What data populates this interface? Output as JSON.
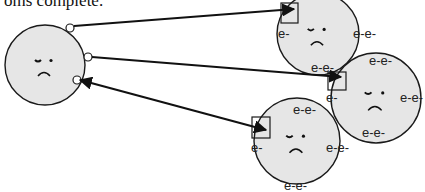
{
  "caption": "oms complete.",
  "colors": {
    "atom_fill": "#e6e6e6",
    "outline": "#1a1a1a",
    "arrow": "#111111"
  },
  "electron_label": "e-",
  "atoms": [
    {
      "id": "central-atom",
      "cx": 45,
      "cy": 65,
      "r": 40,
      "face": "sad",
      "valence_markers": [
        {
          "x": 70,
          "y": 28
        },
        {
          "x": 88,
          "y": 57
        },
        {
          "x": 77,
          "y": 80
        }
      ],
      "electron_labels": []
    },
    {
      "id": "atom-top-right",
      "cx": 318,
      "cy": 34,
      "r": 41,
      "face": "sad",
      "box": {
        "x": 281,
        "y": 3,
        "w": 17,
        "h": 20
      },
      "electron_labels": [
        {
          "text": "e-",
          "x": 278,
          "y": 38
        },
        {
          "text": "e-e-",
          "x": 353,
          "y": 38
        },
        {
          "text": "e-e-",
          "x": 311,
          "y": 72
        }
      ]
    },
    {
      "id": "atom-middle-right",
      "cx": 376,
      "cy": 98,
      "r": 45,
      "face": "sad",
      "box": {
        "x": 328,
        "y": 72,
        "w": 18,
        "h": 18
      },
      "electron_labels": [
        {
          "text": "e-e-",
          "x": 369,
          "y": 65
        },
        {
          "text": "e-",
          "x": 326,
          "y": 102
        },
        {
          "text": "e-e-",
          "x": 400,
          "y": 102
        },
        {
          "text": "e-e-",
          "x": 362,
          "y": 137
        }
      ]
    },
    {
      "id": "atom-bottom",
      "cx": 297,
      "cy": 141,
      "r": 43,
      "face": "sad",
      "box": {
        "x": 252,
        "y": 117,
        "w": 18,
        "h": 21
      },
      "electron_labels": [
        {
          "text": "e-e-",
          "x": 293,
          "y": 114
        },
        {
          "text": "e-",
          "x": 251,
          "y": 152
        },
        {
          "text": "e-e-",
          "x": 326,
          "y": 152
        },
        {
          "text": "e-e-",
          "x": 284,
          "y": 190
        }
      ]
    }
  ],
  "arrows": [
    {
      "id": "arrow-to-top-right",
      "x1": 74,
      "y1": 26,
      "x2": 294,
      "y2": 9,
      "head_end": true,
      "head_start": false
    },
    {
      "id": "arrow-to-middle-right",
      "x1": 92,
      "y1": 57,
      "x2": 341,
      "y2": 77,
      "head_end": true,
      "head_start": false
    },
    {
      "id": "arrow-to-bottom",
      "x1": 80,
      "y1": 80,
      "x2": 266,
      "y2": 130,
      "head_end": true,
      "head_start": true
    }
  ]
}
